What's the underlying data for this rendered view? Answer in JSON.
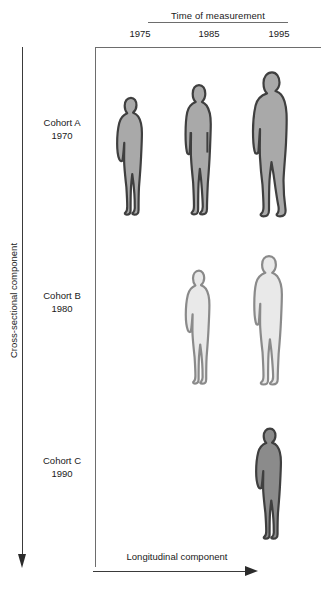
{
  "axes": {
    "top_title": "Time of measurement",
    "year_ticks": [
      "1975",
      "1985",
      "1995"
    ],
    "vertical_label": "Cross-sectional component",
    "horizontal_label": "Longitudinal component"
  },
  "cohorts": [
    {
      "name": "Cohort A",
      "birth_year": "1970",
      "fill": "#a9a9a9",
      "stroke": "#3f3f3f"
    },
    {
      "name": "Cohort B",
      "birth_year": "1980",
      "fill": "#e9e9e9",
      "stroke": "#8a8a8a"
    },
    {
      "name": "Cohort C",
      "birth_year": "1990",
      "fill": "#8b8b8b",
      "stroke": "#3f3f3f"
    }
  ],
  "chart_data": {
    "type": "diagram",
    "xlabel": "Time of measurement",
    "ylabel": "Cross-sectional component",
    "annotations": [
      "Longitudinal component"
    ],
    "columns": [
      "1975",
      "1985",
      "1995"
    ],
    "rows": [
      "Cohort A 1970",
      "Cohort B 1980",
      "Cohort C 1990"
    ],
    "cells": [
      {
        "row": "Cohort A 1970",
        "column": "1975",
        "age": 5,
        "figure": "child",
        "height_px": 120,
        "present": true
      },
      {
        "row": "Cohort A 1970",
        "column": "1985",
        "age": 15,
        "figure": "adolescent",
        "height_px": 132,
        "present": true
      },
      {
        "row": "Cohort A 1970",
        "column": "1995",
        "age": 25,
        "figure": "adult",
        "height_px": 147,
        "present": true
      },
      {
        "row": "Cohort B 1980",
        "column": "1975",
        "present": false
      },
      {
        "row": "Cohort B 1980",
        "column": "1985",
        "age": 5,
        "figure": "child",
        "height_px": 118,
        "present": true
      },
      {
        "row": "Cohort B 1980",
        "column": "1995",
        "age": 15,
        "figure": "adolescent",
        "height_px": 133,
        "present": true
      },
      {
        "row": "Cohort C 1990",
        "column": "1975",
        "present": false
      },
      {
        "row": "Cohort C 1990",
        "column": "1985",
        "present": false
      },
      {
        "row": "Cohort C 1990",
        "column": "1995",
        "age": 5,
        "figure": "child",
        "height_px": 113,
        "present": true
      }
    ]
  }
}
